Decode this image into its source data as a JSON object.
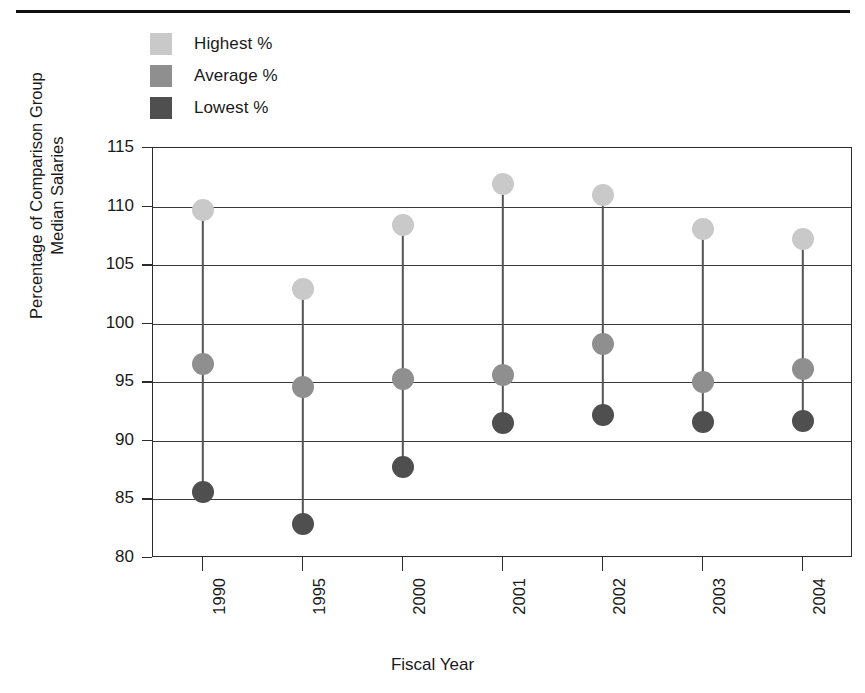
{
  "legend": {
    "items": [
      {
        "label": "Highest %",
        "color": "#c9c9c9"
      },
      {
        "label": "Average %",
        "color": "#8f8f8f"
      },
      {
        "label": "Lowest %",
        "color": "#4f4f4f"
      }
    ]
  },
  "axis": {
    "y_title_line1": "Percentage of Comparison Group",
    "y_title_line2": "Median Salaries",
    "x_title": "Fiscal Year"
  },
  "chart_data": {
    "type": "scatter",
    "title": "",
    "subtitle": "",
    "xlabel": "Fiscal Year",
    "ylabel": "Percentage of Comparison Group Median Salaries",
    "categories": [
      "1990",
      "1995",
      "2000",
      "2001",
      "2002",
      "2003",
      "2004"
    ],
    "ylim": [
      80,
      115
    ],
    "yticks": [
      80,
      85,
      90,
      95,
      100,
      105,
      110,
      115
    ],
    "ytick_labels": [
      "80",
      "85",
      "90",
      "95",
      "100",
      "105",
      "110",
      "115"
    ],
    "grid": true,
    "legend_position": "top-left",
    "series": [
      {
        "name": "Highest %",
        "color": "#c9c9c9",
        "values": [
          109.7,
          103.0,
          108.4,
          111.9,
          111.0,
          108.1,
          107.2
        ]
      },
      {
        "name": "Average %",
        "color": "#8f8f8f",
        "values": [
          96.6,
          94.6,
          95.3,
          95.6,
          98.3,
          95.0,
          96.1
        ]
      },
      {
        "name": "Lowest %",
        "color": "#4f4f4f",
        "values": [
          85.6,
          82.9,
          87.8,
          91.5,
          92.2,
          91.6,
          91.7
        ]
      }
    ]
  }
}
